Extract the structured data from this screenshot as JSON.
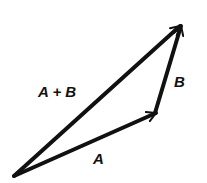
{
  "diagram": {
    "colors": {
      "stroke": "#111111",
      "background": "#ffffff"
    },
    "points": {
      "origin": [
        14,
        176
      ],
      "a_tip": [
        156,
        113
      ],
      "b_tip": [
        181,
        24
      ]
    },
    "vectors": [
      {
        "id": "A",
        "from": "origin",
        "to": "a_tip",
        "label": "A"
      },
      {
        "id": "B",
        "from": "a_tip",
        "to": "b_tip",
        "label": "B"
      },
      {
        "id": "A+B",
        "from": "origin",
        "to": "b_tip",
        "label": "A + B"
      }
    ],
    "labels": {
      "sum": "A + B",
      "b": "B",
      "a": "A"
    }
  }
}
